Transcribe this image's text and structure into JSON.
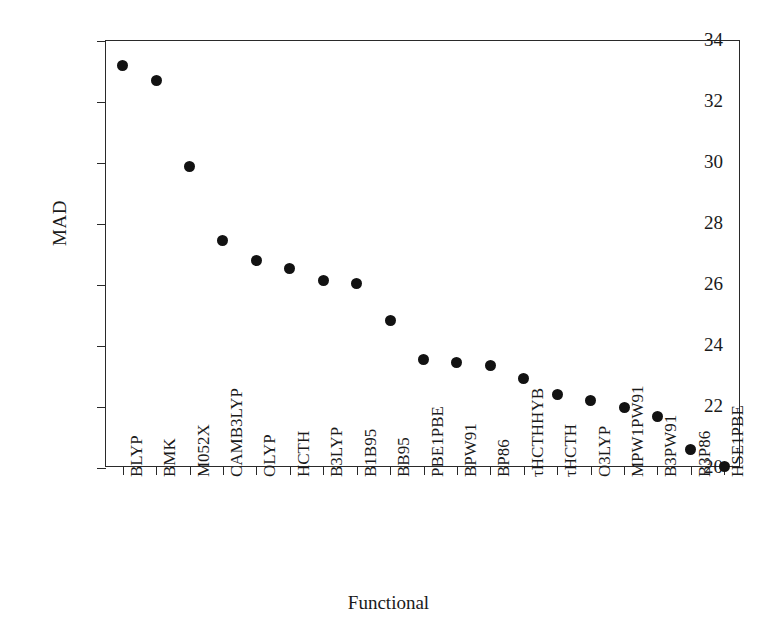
{
  "chart_data": {
    "type": "scatter",
    "title": "",
    "xlabel": "Functional",
    "ylabel": "MAD",
    "categories": [
      "BLYP",
      "BMK",
      "M052X",
      "CAMB3LYP",
      "OLYP",
      "HCTH",
      "B3LYP",
      "B1B95",
      "BB95",
      "PBE1PBE",
      "BPW91",
      "BP86",
      "τHCTHHYB",
      "τHCTH",
      "O3LYP",
      "MPW1PW91",
      "B3PW91",
      "B3P86",
      "HSE1PBE"
    ],
    "values": [
      33.2,
      32.7,
      29.9,
      27.45,
      26.8,
      26.55,
      26.15,
      26.05,
      24.85,
      23.55,
      23.45,
      23.35,
      22.95,
      22.4,
      22.2,
      22.0,
      21.7,
      20.6,
      20.05
    ],
    "ylim": [
      20,
      34
    ],
    "ytick_labels": [
      "34",
      "32",
      "30",
      "28",
      "26",
      "24",
      "22",
      "20"
    ],
    "ytick_values": [
      34,
      32,
      30,
      28,
      26,
      24,
      22,
      20
    ],
    "grid": false,
    "legend": false,
    "marker": "filled-circle",
    "marker_color": "#121212",
    "axis_color": "#2a2a2a",
    "background": "#ffffff"
  }
}
